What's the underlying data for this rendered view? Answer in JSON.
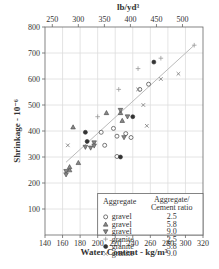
{
  "chart_data": {
    "type": "scatter",
    "title": "",
    "xlabel": "Water Content - kg/m³",
    "ylabel": "Shrinkage - 10⁻⁶",
    "x2label": "lb/yd³",
    "xlim": [
      140,
      320
    ],
    "ylim": [
      0,
      800
    ],
    "x_ticks": [
      140,
      160,
      180,
      200,
      220,
      240,
      260,
      280,
      300,
      320
    ],
    "y_ticks": [
      100,
      200,
      300,
      400,
      500,
      600,
      700,
      800
    ],
    "x2_ticks": [
      250,
      300,
      350,
      400,
      450,
      500
    ],
    "grid": true,
    "legend": {
      "position": "lower right",
      "header_col1": "Aggregate",
      "header_col2_line1": "Aggregate/",
      "header_col2_line2": "Cement ratio",
      "entries": [
        {
          "symbol": "circle-open",
          "aggregate": "gravel",
          "ratio": "2.5"
        },
        {
          "symbol": "triangle-up",
          "aggregate": "gravel",
          "ratio": "5.8"
        },
        {
          "symbol": "triangle-down",
          "aggregate": "gravel",
          "ratio": "9.0"
        },
        {
          "symbol": "plus",
          "aggregate": "granite",
          "ratio": "2.5"
        },
        {
          "symbol": "circle-filled",
          "aggregate": "granite",
          "ratio": "5.8"
        },
        {
          "symbol": "x",
          "aggregate": "granite",
          "ratio": "9.0"
        }
      ]
    },
    "trend_line": {
      "x": [
        164,
        310
      ],
      "y": [
        280,
        730
      ]
    },
    "series": [
      {
        "name": "gravel 2.5",
        "symbol": "circle-open",
        "points": [
          [
            204,
            395
          ],
          [
            218,
            410
          ],
          [
            222,
            380
          ],
          [
            232,
            390
          ],
          [
            208,
            345
          ],
          [
            222,
            302
          ],
          [
            238,
            375
          ],
          [
            248,
            560
          ],
          [
            258,
            580
          ]
        ]
      },
      {
        "name": "gravel 5.8",
        "symbol": "triangle-up",
        "points": [
          [
            172,
            415
          ],
          [
            178,
            278
          ],
          [
            210,
            470
          ],
          [
            228,
            440
          ],
          [
            226,
            470
          ],
          [
            168,
            250
          ],
          [
            168,
            262
          ]
        ]
      },
      {
        "name": "gravel 9.0",
        "symbol": "triangle-down",
        "points": [
          [
            186,
            338
          ],
          [
            192,
            335
          ],
          [
            196,
            355
          ],
          [
            196,
            343
          ],
          [
            226,
            480
          ],
          [
            234,
            455
          ],
          [
            230,
            375
          ],
          [
            164,
            245
          ],
          [
            164,
            232
          ]
        ]
      },
      {
        "name": "granite 2.5",
        "symbol": "plus",
        "points": [
          [
            200,
            455
          ],
          [
            224,
            560
          ],
          [
            246,
            640
          ],
          [
            272,
            680
          ],
          [
            310,
            730
          ]
        ]
      },
      {
        "name": "granite 5.8",
        "symbol": "circle-filled",
        "points": [
          [
            186,
            395
          ],
          [
            188,
            360
          ],
          [
            264,
            665
          ],
          [
            240,
            455
          ],
          [
            226,
            300
          ]
        ]
      },
      {
        "name": "granite 9.0",
        "symbol": "x",
        "points": [
          [
            166,
            345
          ],
          [
            246,
            560
          ],
          [
            252,
            500
          ],
          [
            256,
            420
          ],
          [
            272,
            600
          ],
          [
            292,
            620
          ]
        ]
      }
    ]
  }
}
